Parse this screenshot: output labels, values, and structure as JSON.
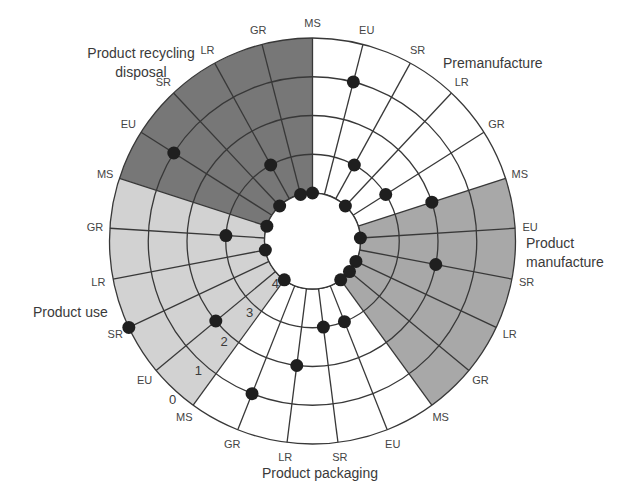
{
  "chart_data": {
    "type": "scatter",
    "coordinate_system": "polar",
    "title": "",
    "xlabel": "",
    "ylabel": "",
    "concerns": [
      "MS",
      "EU",
      "SR",
      "LR",
      "GR"
    ],
    "scale": {
      "ticks": [
        0,
        1,
        2,
        3,
        4
      ],
      "tick_labels": [
        "0",
        "1",
        "2",
        "3",
        "4"
      ],
      "outer_value": 0,
      "inner_value": 4
    },
    "stages": [
      {
        "name": "Premanufacture",
        "label_lines": [
          "Premanufacture"
        ],
        "fill": "#ffffff",
        "values": {
          "MS": 4,
          "EU": 1,
          "SR": 3,
          "LR": 4,
          "GR": 3
        }
      },
      {
        "name": "Product manufacture",
        "label_lines": [
          "Product",
          "manufacture"
        ],
        "fill": "#a8a8a8",
        "values": {
          "MS": 2,
          "EU": 4,
          "SR": 2,
          "LR": 4,
          "GR": 4
        }
      },
      {
        "name": "Product packaging",
        "label_lines": [
          "Product packaging"
        ],
        "fill": "#ffffff",
        "values": {
          "MS": 4,
          "EU": 3,
          "SR": 3,
          "LR": 2,
          "GR": 1
        }
      },
      {
        "name": "Product use",
        "label_lines": [
          "Product use"
        ],
        "fill": "#d2d2d2",
        "values": {
          "MS": 4,
          "EU": 2,
          "SR": 0,
          "LR": 4,
          "GR": 3
        }
      },
      {
        "name": "Product recycling disposal",
        "label_lines": [
          "Product recycling",
          "disposal"
        ],
        "fill": "#777777",
        "values": {
          "MS": 4,
          "EU": 1,
          "SR": 4,
          "LR": 3,
          "GR": 4
        }
      }
    ],
    "grid": true,
    "legend": null
  },
  "colors": {
    "grid_line": "#383838",
    "marker": "#1f1f1f",
    "hole": "#ffffff"
  }
}
